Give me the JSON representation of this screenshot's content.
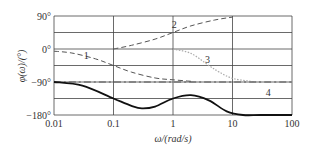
{
  "chart_data": {
    "type": "line",
    "title": "",
    "xlabel": "ω/(rad/s)",
    "ylabel": "φ(ω)/(°)",
    "xscale": "log",
    "xlim": [
      0.01,
      100
    ],
    "ylim": [
      -180,
      90
    ],
    "grid": true,
    "x_ticks": [
      "0.01",
      "0.1",
      "1",
      "10",
      "100"
    ],
    "y_ticks": [
      "90°",
      "0°",
      "−90°",
      "−180°"
    ],
    "series": [
      {
        "name": "1",
        "style": "dashed",
        "x": [
          0.01,
          0.02,
          0.05,
          0.1,
          0.2,
          0.5,
          1,
          2
        ],
        "y": [
          -6,
          -11,
          -27,
          -45,
          -63,
          -79,
          -84,
          -88
        ]
      },
      {
        "name": "2",
        "style": "dashed",
        "x": [
          0.1,
          0.2,
          0.5,
          1,
          2,
          5,
          10
        ],
        "y": [
          0,
          10,
          27,
          45,
          63,
          79,
          87
        ]
      },
      {
        "name": "3",
        "style": "dotted",
        "x": [
          1,
          2,
          4,
          6,
          10,
          20,
          30
        ],
        "y": [
          0,
          -12,
          -45,
          -63,
          -80,
          -88,
          -90
        ]
      },
      {
        "name": "4",
        "style": "dash-dot",
        "x": [
          0.01,
          100
        ],
        "y": [
          -90,
          -90
        ]
      },
      {
        "name": "sum",
        "style": "solid",
        "x": [
          0.01,
          0.03,
          0.1,
          0.2,
          0.3,
          0.5,
          1,
          2,
          4,
          8,
          15,
          30,
          100
        ],
        "y": [
          -90,
          -100,
          -135,
          -155,
          -162,
          -157,
          -135,
          -126,
          -140,
          -170,
          -180,
          -180,
          -180
        ]
      }
    ],
    "annotations": [
      {
        "text": "1",
        "x": 0.035,
        "y": -20
      },
      {
        "text": "2",
        "x": 1.05,
        "y": 66
      },
      {
        "text": "3",
        "x": 3.8,
        "y": -30
      },
      {
        "text": "4",
        "x": 40,
        "y": -120
      }
    ]
  }
}
